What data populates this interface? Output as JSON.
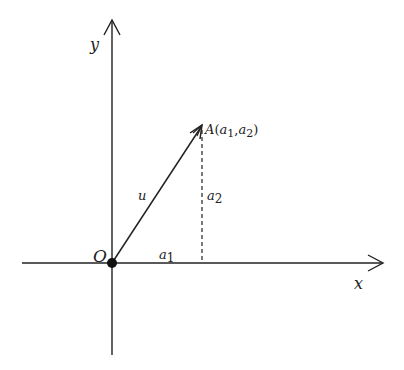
{
  "diagram": {
    "type": "vector-components",
    "axes": {
      "x_label": "x",
      "y_label": "y",
      "origin_label": "O"
    },
    "vector": {
      "name": "u",
      "from": "O",
      "to_point_label": "A",
      "to_point_coords": "(a1, a2)",
      "point_text": {
        "A": "A",
        "open": "(",
        "a": "a",
        "s1": "1",
        "comma": ",",
        "s2": "2",
        "close": ")"
      }
    },
    "components": {
      "horizontal": {
        "base": "a",
        "sub": "1"
      },
      "vertical": {
        "base": "a",
        "sub": "2"
      }
    },
    "colors": {
      "stroke": "#222222",
      "background": "#ffffff"
    }
  }
}
